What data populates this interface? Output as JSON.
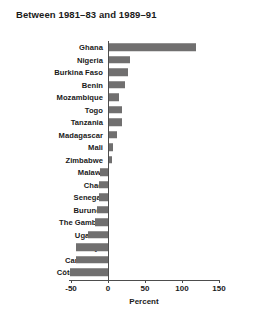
{
  "chart_data": {
    "type": "bar",
    "orientation": "horizontal",
    "title": "Between 1981–83 and 1989–91",
    "xlabel": "Percent",
    "ylabel": "",
    "xlim": [
      -50,
      150
    ],
    "xticks": [
      -50,
      0,
      50,
      100,
      150
    ],
    "xtick_labels": [
      "-50",
      "0",
      "50",
      "100",
      "150"
    ],
    "grid": false,
    "legend": null,
    "bar_color": "#706f6f",
    "axis_color": "#4d4d4d",
    "categories": [
      "Ghana",
      "Nigeria",
      "Burkina Faso",
      "Benin",
      "Mozambique",
      "Togo",
      "Tanzania",
      "Madagascar",
      "Mali",
      "Zimbabwe",
      "Malawi",
      "Chad",
      "Senegal",
      "Burundi",
      "The Gambia",
      "Uganda",
      "Kenya",
      "Cameroon",
      "Côte d'Ivoire"
    ],
    "values": [
      119,
      30,
      27,
      23,
      15,
      19,
      19,
      12,
      7,
      5,
      -11,
      -12,
      -12,
      -15,
      -18,
      -27,
      -43,
      -43,
      -51
    ]
  }
}
